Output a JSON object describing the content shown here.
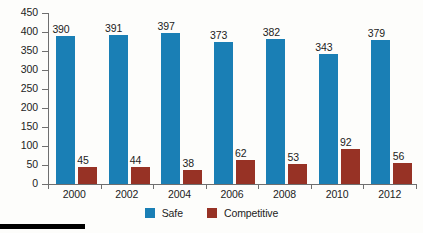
{
  "chart_data": {
    "type": "bar",
    "title": "",
    "subtitle": "",
    "xlabel": "",
    "ylabel": "",
    "categories": [
      "2000",
      "2002",
      "2004",
      "2006",
      "2008",
      "2010",
      "2012"
    ],
    "series": [
      {
        "name": "Safe",
        "color": "#1a7fb5",
        "values": [
          390,
          391,
          397,
          373,
          382,
          343,
          379
        ]
      },
      {
        "name": "Competitive",
        "color": "#973225",
        "values": [
          45,
          44,
          38,
          62,
          53,
          92,
          56
        ]
      }
    ],
    "ylim": [
      0,
      450
    ],
    "ytick_step": 50,
    "ytick_labels": [
      "450",
      "400",
      "350",
      "300",
      "250",
      "200",
      "150",
      "100",
      "50",
      "0"
    ],
    "grid": false,
    "data_labels": true,
    "legend_position": "bottom"
  },
  "legend": {
    "items": [
      {
        "label": "Safe",
        "swatch": "safe"
      },
      {
        "label": "Competitive",
        "swatch": "comp"
      }
    ]
  },
  "decor": {
    "bottom_rule_color": "#000000"
  }
}
